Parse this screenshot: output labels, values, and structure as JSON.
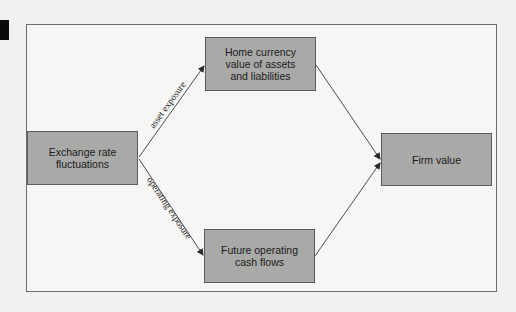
{
  "diagram": {
    "nodes": {
      "exchange_rate": {
        "label": "Exchange rate\nfluctuations"
      },
      "home_currency": {
        "label": "Home currency\nvalue of assets\nand liabilities"
      },
      "future_cash": {
        "label": "Future operating\ncash flows"
      },
      "firm_value": {
        "label": "Firm value"
      }
    },
    "edges": [
      {
        "from": "exchange_rate",
        "to": "home_currency",
        "label": "asset exposure"
      },
      {
        "from": "exchange_rate",
        "to": "future_cash",
        "label": "operating exposure"
      },
      {
        "from": "home_currency",
        "to": "firm_value",
        "label": ""
      },
      {
        "from": "future_cash",
        "to": "firm_value",
        "label": ""
      }
    ],
    "colors": {
      "box_fill": "#a9a9a7",
      "box_border": "#5c5c5c",
      "frame_border": "#6b6b6b",
      "background": "#f1f1ef"
    }
  }
}
